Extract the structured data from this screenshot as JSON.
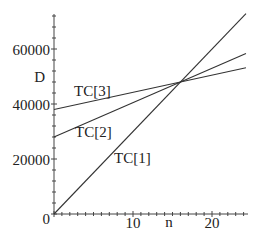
{
  "chart_data": {
    "type": "line",
    "title": "",
    "xlabel": "n",
    "ylabel": "D",
    "xlim": [
      0,
      24.5
    ],
    "ylim": [
      0,
      73000
    ],
    "grid": false,
    "legend": "inline labels",
    "x_ticks": [
      {
        "value": 10,
        "label": "10"
      },
      {
        "value": 20,
        "label": "20"
      }
    ],
    "y_ticks": [
      {
        "value": 0,
        "label": "0"
      },
      {
        "value": 20000,
        "label": "20000"
      },
      {
        "value": 40000,
        "label": "40000"
      },
      {
        "value": 60000,
        "label": "60000"
      }
    ],
    "series": [
      {
        "name": "TC[1]",
        "x": [
          0,
          24.3
        ],
        "values": [
          0,
          72900
        ],
        "intercept": 0,
        "slope": 3000
      },
      {
        "name": "TC[2]",
        "x": [
          0,
          24.3
        ],
        "values": [
          28000,
          58375
        ],
        "intercept": 28000,
        "slope": 1250
      },
      {
        "name": "TC[3]",
        "x": [
          0,
          24.3
        ],
        "values": [
          38000,
          53188
        ],
        "intercept": 38000,
        "slope": 625
      }
    ],
    "annotations": [
      {
        "text": "n",
        "position": "x-axis near intersection",
        "x": 16
      },
      {
        "text": "D",
        "position": "y-axis near intersection value",
        "y": 48000
      }
    ],
    "intersection": {
      "x": 16,
      "y": 48000
    }
  },
  "labels": {
    "y_axis_symbol": "D",
    "x_axis_symbol": "n",
    "origin": "0",
    "tc1": "TC[1]",
    "tc2": "TC[2]",
    "tc3": "TC[3]",
    "x10": "10",
    "x20": "20",
    "y20000": "20000",
    "y40000": "40000",
    "y60000": "60000"
  }
}
